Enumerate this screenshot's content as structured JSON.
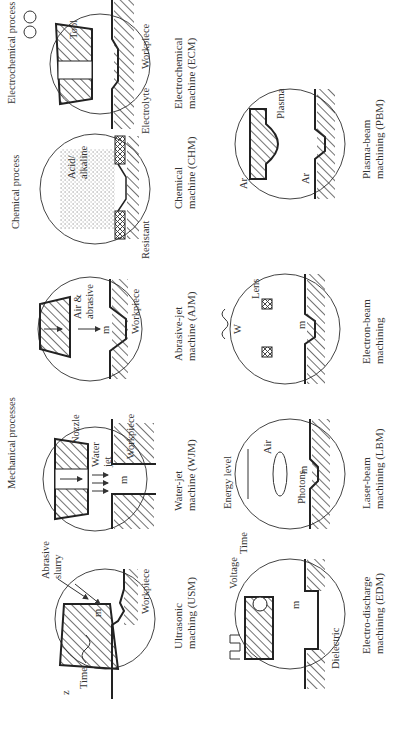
{
  "figure": {
    "orientation": "rotated 90 degrees counter-clockwise",
    "groups": {
      "mechanical": "Mechanical processes",
      "chemical": "Chemical process",
      "electrochemical": "Electrochemical process",
      "energy_level": "Energy level"
    },
    "panels": [
      {
        "id": "usm",
        "caption_1": "Ultrasonic",
        "caption_2": "maching (USM)",
        "labels": [
          "Abrasive",
          "slurry",
          "Workpiece",
          "Time",
          "z",
          "m"
        ]
      },
      {
        "id": "wjm",
        "caption_1": "Water-jet",
        "caption_2": "machine (WJM)",
        "labels": [
          "Nozzle",
          "Water",
          "jet",
          "Workpiece",
          "m"
        ]
      },
      {
        "id": "ajm",
        "caption_1": "Abrasive-jet",
        "caption_2": "machine (AJM)",
        "labels": [
          "Air &",
          "abrasive",
          "Workpiece",
          "m"
        ]
      },
      {
        "id": "chm",
        "caption_1": "Chemical",
        "caption_2": "machine (CHM)",
        "labels": [
          "Acid/",
          "alkaline",
          "Resistant"
        ]
      },
      {
        "id": "ecm",
        "caption_1": "Electrochemical",
        "caption_2": "machine (ECM)",
        "labels": [
          "Tool",
          "Electrolyte",
          "Workpiece"
        ]
      },
      {
        "id": "edm",
        "caption_1": "Electro-discharge",
        "caption_2": "machining (EDM)",
        "labels": [
          "Voltage",
          "Time",
          "Dielectric",
          "m"
        ]
      },
      {
        "id": "lbm",
        "caption_1": "Laser-beam",
        "caption_2": "machining (LBM)",
        "labels": [
          "Air",
          "Photons",
          "m"
        ]
      },
      {
        "id": "ebm",
        "caption_1": "Electron-beam",
        "caption_2": "machining",
        "labels": [
          "Lens",
          "W",
          "m"
        ]
      },
      {
        "id": "pbm",
        "caption_1": "Plasma-beam",
        "caption_2": "machining (PBM)",
        "labels": [
          "Plasma",
          "Ar",
          "Ar"
        ]
      }
    ]
  }
}
